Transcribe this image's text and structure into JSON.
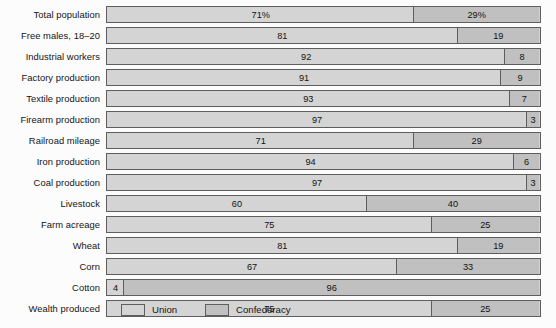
{
  "chart_data": {
    "type": "bar",
    "subtype": "stacked-horizontal-100pct",
    "title": "",
    "subtitle": "",
    "xlabel": "",
    "ylabel": "",
    "xlim": [
      0,
      100
    ],
    "grid": false,
    "legend_position": "bottom",
    "categories": [
      "Total population",
      "Free males, 18–20",
      "Industrial workers",
      "Factory production",
      "Textile production",
      "Firearm production",
      "Railroad mileage",
      "Iron production",
      "Coal production",
      "Livestock",
      "Farm acreage",
      "Wheat",
      "Corn",
      "Cotton",
      "Wealth produced"
    ],
    "series": [
      {
        "name": "Union",
        "values": [
          71,
          81,
          92,
          91,
          93,
          97,
          71,
          94,
          97,
          60,
          75,
          81,
          67,
          4,
          75
        ],
        "labels": [
          "71%",
          "81",
          "92",
          "91",
          "93",
          "97",
          "71",
          "94",
          "97",
          "60",
          "75",
          "81",
          "67",
          "4",
          "75"
        ],
        "color": "#d4d4d4"
      },
      {
        "name": "Confederacy",
        "values": [
          29,
          19,
          8,
          9,
          7,
          3,
          29,
          6,
          3,
          40,
          25,
          19,
          33,
          96,
          25
        ],
        "labels": [
          "29%",
          "19",
          "8",
          "9",
          "7",
          "3",
          "29",
          "6",
          "3",
          "40",
          "25",
          "19",
          "33",
          "96",
          "25"
        ],
        "color": "#c0c0c0"
      }
    ]
  },
  "legend": {
    "items": [
      {
        "label": "Union",
        "color": "#d4d4d4"
      },
      {
        "label": "Confederacy",
        "color": "#c0c0c0"
      }
    ]
  },
  "colors": {
    "background": "#fcfcfc",
    "bar_border": "#5e5e5e",
    "union": "#d4d4d4",
    "confederacy": "#c0c0c0",
    "text": "#141414"
  }
}
